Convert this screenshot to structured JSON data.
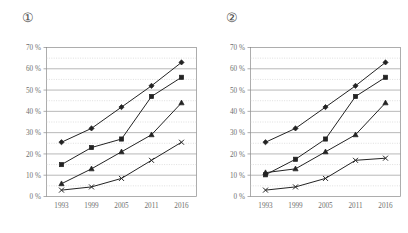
{
  "page": {
    "background_color": "#ffffff",
    "text_color": "#6e6e6e",
    "line_color": "#232323",
    "grid_major_color": "#9a9a9a",
    "grid_minor_color": "#c9c9c9"
  },
  "panels": [
    {
      "label": "①",
      "name": "chart-one"
    },
    {
      "label": "②",
      "name": "chart-two"
    }
  ],
  "chart_data": [
    {
      "type": "line",
      "title": "①",
      "xlabel": "",
      "ylabel": "",
      "categories": [
        "1993",
        "1999",
        "2005",
        "2011",
        "2016"
      ],
      "x": [
        1993,
        1999,
        2005,
        2011,
        2016
      ],
      "ylim": [
        0,
        70
      ],
      "yticks": [
        0,
        10,
        20,
        30,
        40,
        50,
        60,
        70
      ],
      "ytick_labels": [
        "0 %",
        "10 %",
        "20 %",
        "30 %",
        "40 %",
        "50 %",
        "60 %",
        "70 %"
      ],
      "minor_yticks": [
        5,
        15,
        25,
        35,
        45,
        55,
        65
      ],
      "grid": "major-solid-minor-dotted",
      "legend": "none",
      "series": [
        {
          "name": "series-diamond",
          "marker": "diamond",
          "values": [
            25.5,
            32.0,
            42.0,
            52.0,
            63.0
          ]
        },
        {
          "name": "series-square",
          "marker": "square",
          "values": [
            15.0,
            23.0,
            27.0,
            47.0,
            56.0
          ]
        },
        {
          "name": "series-triangle",
          "marker": "triangle",
          "values": [
            6.0,
            13.0,
            21.0,
            29.0,
            44.0
          ]
        },
        {
          "name": "series-cross",
          "marker": "x",
          "values": [
            3.0,
            4.5,
            8.5,
            17.0,
            25.5
          ]
        }
      ]
    },
    {
      "type": "line",
      "title": "②",
      "xlabel": "",
      "ylabel": "",
      "categories": [
        "1993",
        "1999",
        "2005",
        "2011",
        "2016"
      ],
      "x": [
        1993,
        1999,
        2005,
        2011,
        2016
      ],
      "ylim": [
        0,
        70
      ],
      "yticks": [
        0,
        10,
        20,
        30,
        40,
        50,
        60,
        70
      ],
      "ytick_labels": [
        "0 %",
        "10 %",
        "20 %",
        "30 %",
        "40 %",
        "50 %",
        "60 %",
        "70 %"
      ],
      "minor_yticks": [
        5,
        15,
        25,
        35,
        45,
        55,
        65
      ],
      "grid": "major-solid-minor-dotted",
      "legend": "none",
      "series": [
        {
          "name": "series-diamond",
          "marker": "diamond",
          "values": [
            25.5,
            32.0,
            42.0,
            52.0,
            63.0
          ]
        },
        {
          "name": "series-square",
          "marker": "square",
          "values": [
            10.2,
            17.5,
            27.0,
            47.0,
            56.0
          ]
        },
        {
          "name": "series-triangle",
          "marker": "triangle",
          "values": [
            11.2,
            13.0,
            21.0,
            29.0,
            44.0
          ]
        },
        {
          "name": "series-cross",
          "marker": "x",
          "values": [
            3.0,
            4.5,
            8.5,
            17.0,
            18.0
          ]
        }
      ]
    }
  ]
}
